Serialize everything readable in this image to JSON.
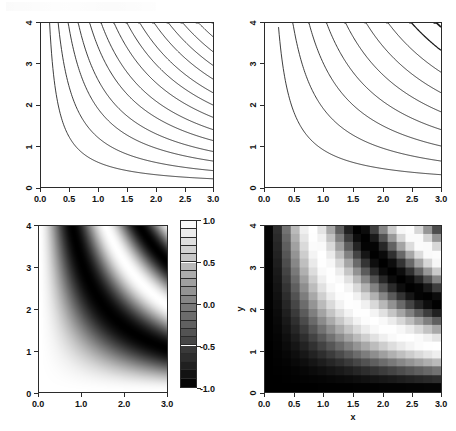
{
  "figure": {
    "title": "",
    "layout": "2x2 panel grid",
    "background": "#ffffff",
    "foreground": "#000000"
  },
  "chart_data": [
    {
      "id": "panel-top-left",
      "type": "contour",
      "title": "",
      "xlabel": "",
      "ylabel": "",
      "xlim": [
        0.0,
        3.0
      ],
      "ylim": [
        0.0,
        4.0
      ],
      "xticks": [
        0.0,
        0.5,
        1.0,
        1.5,
        2.0,
        2.5,
        3.0
      ],
      "xticklabels": [
        "0.0",
        "0.5",
        "1.0",
        "1.5",
        "2.0",
        "2.5",
        "3.0"
      ],
      "yticks": [
        0,
        1,
        2,
        3,
        4
      ],
      "yticklabels": [
        "0",
        "1",
        "2",
        "3",
        "4"
      ],
      "ytick_label_rotation": -90,
      "grid": false,
      "legend": false,
      "function": "sin(x*y) style hyperbolic level sets; contour lines are hyperbolae x*y = const",
      "levels": [
        0.6,
        1.2,
        1.9,
        2.6,
        3.4,
        4.2,
        5.1,
        6.0,
        6.9,
        7.9,
        8.9,
        9.9,
        11.0,
        12.1,
        13.2,
        14.4,
        15.6,
        16.8,
        18.1,
        19.4,
        20.7,
        22.1,
        23.5,
        24.9,
        26.4,
        27.9,
        29.4,
        31.0,
        32.6,
        34.2
      ],
      "line_color": "#1a1a1a",
      "line_width": 0.9,
      "n_contours": 30
    },
    {
      "id": "panel-top-right",
      "type": "contour",
      "title": "",
      "xlabel": "",
      "ylabel": "",
      "xlim": [
        0.0,
        3.0
      ],
      "ylim": [
        0.0,
        4.0
      ],
      "xticks": [
        0.0,
        0.5,
        1.0,
        1.5,
        2.0,
        2.5,
        3.0
      ],
      "xticklabels": [
        "0.0",
        "0.5",
        "1.0",
        "1.5",
        "2.0",
        "2.5",
        "3.0"
      ],
      "yticks": [
        0,
        1,
        2,
        3,
        4
      ],
      "yticklabels": [
        "0",
        "1",
        "2",
        "3",
        "4"
      ],
      "ytick_label_rotation": -90,
      "grid": false,
      "legend": false,
      "function": "same hyperbolic family, contours bundled into thick dense bands at higher levels",
      "levels": [
        0.9,
        1.9,
        3.0,
        4.2,
        5.5,
        6.9,
        8.4,
        10.0,
        11.7,
        13.5,
        15.4,
        17.4,
        19.5,
        21.7,
        24.0,
        26.4,
        28.9,
        31.5,
        34.2
      ],
      "line_color": "#1a1a1a",
      "line_width": 0.9,
      "n_contours": 19,
      "note": "bundles of closely-spaced contours render as solid dark ribbons"
    },
    {
      "id": "panel-bottom-left",
      "type": "heatmap",
      "title": "",
      "xlabel": "",
      "ylabel": "",
      "xlim": [
        0.0,
        3.0
      ],
      "ylim": [
        0.0,
        4.0
      ],
      "xticks": [
        0.0,
        1.0,
        2.0,
        3.0
      ],
      "xticklabels": [
        "0.0",
        "1.0",
        "2.0",
        "3.0"
      ],
      "yticks": [
        0,
        1,
        2,
        3,
        4
      ],
      "yticklabels": [
        "0",
        "1",
        "2",
        "3",
        "4"
      ],
      "ytick_label_rotation": 0,
      "grid": false,
      "resolution": "smooth / high resolution",
      "colormap": "gray",
      "zlim": [
        -1.0,
        1.0
      ],
      "function": "cos(x*y) over x in [0,3], y in [0,4]",
      "colorbar": {
        "orientation": "vertical",
        "position": "right",
        "ticks": [
          1.0,
          0.5,
          0.0,
          -0.5,
          -1.0
        ],
        "ticklabels": [
          "1.0",
          "0.5",
          "0.0",
          "-0.5",
          "-1.0"
        ],
        "n_bands": 20,
        "top_value": "1.0",
        "bottom_value": "-1.0",
        "top_color": "#ffffff",
        "bottom_color": "#000000"
      }
    },
    {
      "id": "panel-bottom-right",
      "type": "heatmap",
      "title": "",
      "xlabel": "x",
      "ylabel": "y",
      "xlim": [
        0.0,
        3.0
      ],
      "ylim": [
        0.0,
        4.0
      ],
      "xticks": [
        0.0,
        0.5,
        1.0,
        1.5,
        2.0,
        2.5,
        3.0
      ],
      "xticklabels": [
        "0.0",
        "0.5",
        "1.0",
        "1.5",
        "2.0",
        "2.5",
        "3.0"
      ],
      "yticks": [
        0,
        1,
        2,
        3,
        4
      ],
      "yticklabels": [
        "0",
        "1",
        "2",
        "3",
        "4"
      ],
      "ytick_label_rotation": -90,
      "grid": false,
      "resolution": "coarse 20x20 blocks",
      "colormap": "gray",
      "zlim": [
        -1.0,
        1.0
      ],
      "function": "-cos(x*y) sampled on a coarse 20x20 grid (inverted contrast vs bottom-left)",
      "colorbar": null
    }
  ]
}
